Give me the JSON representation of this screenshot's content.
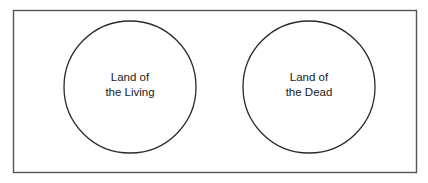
{
  "diagram": {
    "frame": {
      "x": 13,
      "y": 10,
      "width": 403,
      "height": 162,
      "stroke": "#555555"
    },
    "circles": [
      {
        "id": "living",
        "cx": 130,
        "cy": 87,
        "r": 66,
        "line1": "Land of",
        "line2": "the Living"
      },
      {
        "id": "dead",
        "cx": 309,
        "cy": 87,
        "r": 66,
        "line1": "Land of",
        "line2": "the Dead"
      }
    ],
    "stroke_color": "#2a2a2a"
  }
}
